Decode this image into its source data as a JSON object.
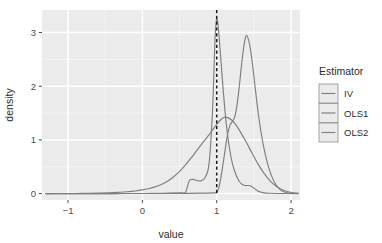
{
  "chart_data": {
    "type": "line",
    "title": "",
    "subtitle": "",
    "xlabel": "value",
    "ylabel": "density",
    "xlim": [
      -1.35,
      2.12
    ],
    "ylim": [
      -0.12,
      3.42
    ],
    "xticks": [
      -1,
      0,
      1,
      2
    ],
    "xticklabels": [
      "−1",
      "0",
      "1",
      "2"
    ],
    "yticks": [
      0,
      1,
      2,
      3
    ],
    "yticklabels": [
      "0",
      "1",
      "2",
      "3"
    ],
    "grid": true,
    "grid_major": true,
    "grid_minor": true,
    "legend": {
      "title": "Estimator",
      "position": "right",
      "entries": [
        {
          "label": "IV",
          "key_type": "box-with-line"
        },
        {
          "label": "OLS1",
          "key_type": "box-with-line"
        },
        {
          "label": "OLS2",
          "key_type": "box-with-line"
        }
      ]
    },
    "annotations": [
      {
        "type": "vline",
        "x": 1,
        "linetype": "dashed",
        "color": "#1a1a1a",
        "label": "true value reference line at value = 1"
      }
    ],
    "series": [
      {
        "name": "IV",
        "peak_x": 1.1,
        "peak_y": 1.42,
        "color": "#7f7f7f",
        "points": [
          [
            -1.3,
            0.0
          ],
          [
            -1.1,
            0.001
          ],
          [
            -0.9,
            0.002
          ],
          [
            -0.75,
            0.004
          ],
          [
            -0.6,
            0.008
          ],
          [
            -0.45,
            0.014
          ],
          [
            -0.3,
            0.024
          ],
          [
            -0.2,
            0.034
          ],
          [
            -0.1,
            0.048
          ],
          [
            0.0,
            0.068
          ],
          [
            0.08,
            0.09
          ],
          [
            0.16,
            0.12
          ],
          [
            0.24,
            0.16
          ],
          [
            0.32,
            0.215
          ],
          [
            0.4,
            0.29
          ],
          [
            0.48,
            0.385
          ],
          [
            0.56,
            0.5
          ],
          [
            0.64,
            0.635
          ],
          [
            0.72,
            0.78
          ],
          [
            0.8,
            0.925
          ],
          [
            0.88,
            1.065
          ],
          [
            0.94,
            1.175
          ],
          [
            1.0,
            1.29
          ],
          [
            1.05,
            1.37
          ],
          [
            1.1,
            1.42
          ],
          [
            1.15,
            1.415
          ],
          [
            1.2,
            1.37
          ],
          [
            1.26,
            1.275
          ],
          [
            1.32,
            1.145
          ],
          [
            1.4,
            0.95
          ],
          [
            1.48,
            0.74
          ],
          [
            1.56,
            0.54
          ],
          [
            1.64,
            0.37
          ],
          [
            1.72,
            0.232
          ],
          [
            1.8,
            0.135
          ],
          [
            1.88,
            0.072
          ],
          [
            1.96,
            0.034
          ],
          [
            2.04,
            0.014
          ],
          [
            2.1,
            0.006
          ]
        ]
      },
      {
        "name": "OLS1",
        "peak_x": 1.0,
        "peak_y": 3.25,
        "color": "#7f7f7f",
        "points": [
          [
            -1.3,
            0.0
          ],
          [
            -0.8,
            0.0
          ],
          [
            -0.4,
            0.0
          ],
          [
            0.0,
            0.002
          ],
          [
            0.2,
            0.004
          ],
          [
            0.4,
            0.008
          ],
          [
            0.52,
            0.014
          ],
          [
            0.58,
            0.022
          ],
          [
            0.62,
            0.2
          ],
          [
            0.64,
            0.255
          ],
          [
            0.68,
            0.265
          ],
          [
            0.72,
            0.25
          ],
          [
            0.76,
            0.235
          ],
          [
            0.8,
            0.245
          ],
          [
            0.84,
            0.29
          ],
          [
            0.88,
            0.42
          ],
          [
            0.9,
            0.6
          ],
          [
            0.92,
            0.95
          ],
          [
            0.94,
            1.45
          ],
          [
            0.955,
            1.95
          ],
          [
            0.965,
            2.4
          ],
          [
            0.975,
            2.8
          ],
          [
            0.985,
            3.08
          ],
          [
            0.995,
            3.23
          ],
          [
            1.005,
            3.25
          ],
          [
            1.015,
            3.17
          ],
          [
            1.03,
            2.95
          ],
          [
            1.05,
            2.6
          ],
          [
            1.07,
            2.23
          ],
          [
            1.09,
            1.88
          ],
          [
            1.11,
            1.56
          ],
          [
            1.13,
            1.28
          ],
          [
            1.16,
            0.95
          ],
          [
            1.19,
            0.7
          ],
          [
            1.22,
            0.51
          ],
          [
            1.26,
            0.345
          ],
          [
            1.3,
            0.235
          ],
          [
            1.34,
            0.175
          ],
          [
            1.38,
            0.15
          ],
          [
            1.42,
            0.15
          ],
          [
            1.46,
            0.14
          ],
          [
            1.5,
            0.1
          ],
          [
            1.54,
            0.06
          ],
          [
            1.58,
            0.032
          ],
          [
            1.64,
            0.014
          ],
          [
            1.7,
            0.006
          ],
          [
            1.8,
            0.002
          ],
          [
            2.1,
            0.0
          ]
        ]
      },
      {
        "name": "OLS2",
        "peak_x": 1.4,
        "peak_y": 2.95,
        "color": "#7f7f7f",
        "points": [
          [
            -1.3,
            0.0
          ],
          [
            -0.8,
            0.0
          ],
          [
            -0.4,
            0.0
          ],
          [
            0.0,
            0.001
          ],
          [
            0.3,
            0.002
          ],
          [
            0.6,
            0.004
          ],
          [
            0.8,
            0.008
          ],
          [
            0.95,
            0.014
          ],
          [
            1.0,
            0.02
          ],
          [
            1.03,
            0.12
          ],
          [
            1.06,
            0.33
          ],
          [
            1.09,
            0.6
          ],
          [
            1.12,
            0.88
          ],
          [
            1.15,
            1.13
          ],
          [
            1.18,
            1.28
          ],
          [
            1.21,
            1.34
          ],
          [
            1.24,
            1.42
          ],
          [
            1.27,
            1.62
          ],
          [
            1.3,
            1.95
          ],
          [
            1.33,
            2.35
          ],
          [
            1.36,
            2.7
          ],
          [
            1.385,
            2.9
          ],
          [
            1.4,
            2.95
          ],
          [
            1.42,
            2.9
          ],
          [
            1.45,
            2.72
          ],
          [
            1.48,
            2.42
          ],
          [
            1.51,
            2.06
          ],
          [
            1.54,
            1.7
          ],
          [
            1.57,
            1.38
          ],
          [
            1.6,
            1.11
          ],
          [
            1.63,
            0.88
          ],
          [
            1.66,
            0.69
          ],
          [
            1.7,
            0.48
          ],
          [
            1.74,
            0.32
          ],
          [
            1.78,
            0.2
          ],
          [
            1.82,
            0.118
          ],
          [
            1.86,
            0.064
          ],
          [
            1.9,
            0.032
          ],
          [
            1.95,
            0.013
          ],
          [
            2.0,
            0.005
          ],
          [
            2.1,
            0.001
          ]
        ]
      }
    ],
    "style": {
      "panel_background": "#ebebeb",
      "grid_major_color": "#ffffff",
      "grid_minor_color": "#f5f5f5",
      "line_color": "#7f7f7f",
      "reference_line_color": "#1a1a1a",
      "text_color": "#2b2b2b",
      "tick_color": "#4d4d4d",
      "legend_key_fill": "#ebebeb",
      "legend_key_border": "#9a9a9a",
      "figure_background": "#ffffff"
    }
  }
}
